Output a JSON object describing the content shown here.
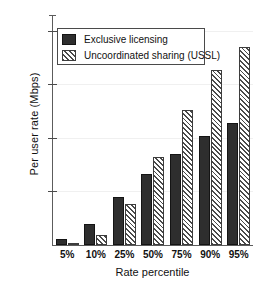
{
  "chart_data": {
    "type": "bar",
    "title": "",
    "xlabel": "Rate percentile",
    "ylabel": "Per user rate (Mbps)",
    "categories": [
      "5%",
      "10%",
      "25%",
      "50%",
      "75%",
      "90%",
      "95%"
    ],
    "series": [
      {
        "name": "Exclusive licensing",
        "style": "solid",
        "color": "#2e2e2e",
        "values": [
          6,
          20,
          45,
          66,
          85,
          102,
          114
        ]
      },
      {
        "name": "Uncoordinated sharing (USSL)",
        "style": "hatched",
        "color": "#4a4a4a",
        "values": [
          2,
          9,
          38,
          82,
          126,
          163,
          185
        ]
      }
    ],
    "ylim": [
      0,
      210
    ],
    "yticks": [
      50,
      100,
      150,
      200
    ],
    "ytick_labels": [
      "50",
      "100",
      "150",
      "200"
    ],
    "grid": false,
    "legend_position": "top-left"
  },
  "legend": {
    "entries": [
      {
        "label": "Exclusive licensing"
      },
      {
        "label": "Uncoordinated sharing (USSL)"
      }
    ]
  }
}
